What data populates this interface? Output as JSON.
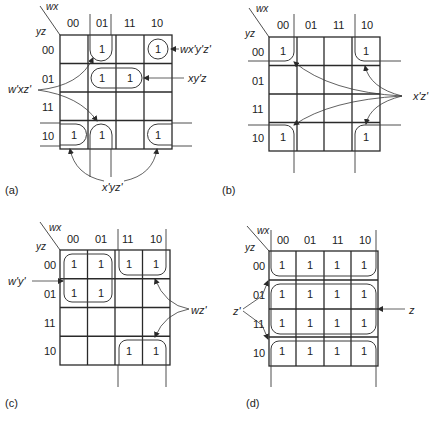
{
  "figure": {
    "col_var": "wx",
    "row_var": "yz",
    "col_labels": [
      "00",
      "01",
      "11",
      "10"
    ],
    "row_labels": [
      "00",
      "01",
      "11",
      "10"
    ],
    "maps": [
      {
        "caption": "(a)",
        "origin": [
          60,
          35
        ],
        "cell_w": 28,
        "cell_h": 28.5,
        "cells": [
          [
            0,
            1,
            0,
            1
          ],
          [
            0,
            1,
            1,
            0
          ],
          [
            0,
            0,
            0,
            0
          ],
          [
            1,
            1,
            0,
            1
          ]
        ],
        "terms": [
          {
            "label": "wx'y'z'",
            "x": 188,
            "y": 53
          },
          {
            "label": "xy'z",
            "x": 188,
            "y": 81
          },
          {
            "label": "w'xz'",
            "x": 8,
            "y": 93
          },
          {
            "label": "x'yz'",
            "x": 102,
            "y": 190
          }
        ]
      },
      {
        "caption": "(b)",
        "origin": [
          269,
          37
        ],
        "cell_w": 27.75,
        "cell_h": 28.5,
        "cells": [
          [
            1,
            0,
            0,
            1
          ],
          [
            0,
            0,
            0,
            0
          ],
          [
            0,
            0,
            0,
            0
          ],
          [
            1,
            0,
            0,
            1
          ]
        ],
        "terms": [
          {
            "label": "x'z'",
            "x": 412,
            "y": 98
          }
        ]
      },
      {
        "caption": "(c)",
        "origin": [
          60,
          250
        ],
        "cell_w": 27.5,
        "cell_h": 28.75,
        "cells": [
          [
            1,
            1,
            1,
            1
          ],
          [
            1,
            1,
            0,
            0
          ],
          [
            0,
            0,
            0,
            0
          ],
          [
            0,
            0,
            1,
            1
          ]
        ],
        "terms": [
          {
            "label": "w'y'",
            "x": 8,
            "y": 285
          },
          {
            "label": "wz'",
            "x": 191,
            "y": 312
          }
        ]
      },
      {
        "caption": "(d)",
        "origin": [
          269,
          251
        ],
        "cell_w": 27.25,
        "cell_h": 28.75,
        "cells": [
          [
            1,
            1,
            1,
            1
          ],
          [
            1,
            1,
            1,
            1
          ],
          [
            1,
            1,
            1,
            1
          ],
          [
            1,
            1,
            1,
            1
          ]
        ],
        "terms": [
          {
            "label": "z'",
            "x": 233,
            "y": 313
          },
          {
            "label": "z",
            "x": 408,
            "y": 313
          }
        ]
      }
    ]
  }
}
